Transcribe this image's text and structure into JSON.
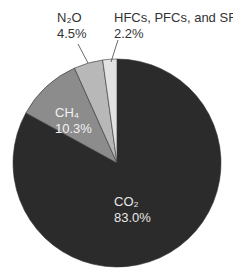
{
  "chart_data": {
    "type": "pie",
    "title": "",
    "slices": [
      {
        "label": "CO2",
        "display": "CO₂",
        "value": 83.0,
        "value_label": "83.0%",
        "color": "#2b2b2b",
        "text_color": "#e8e8e8"
      },
      {
        "label": "CH4",
        "display": "CH₄",
        "value": 10.3,
        "value_label": "10.3%",
        "color": "#8c8c8c",
        "text_color": "#f2f2f2"
      },
      {
        "label": "N2O",
        "display": "N₂O",
        "value": 4.5,
        "value_label": "4.5%",
        "color": "#b8b8b8",
        "text_color": "#333333"
      },
      {
        "label": "HFCs, PFCs, and SF6",
        "display": "HFCs, PFCs, and SF₆",
        "value": 2.2,
        "value_label": "2.2%",
        "color": "#e2e2e2",
        "text_color": "#333333"
      }
    ],
    "start_angle_deg": 0,
    "direction": "clockwise",
    "legend": "none (inline labels)"
  }
}
